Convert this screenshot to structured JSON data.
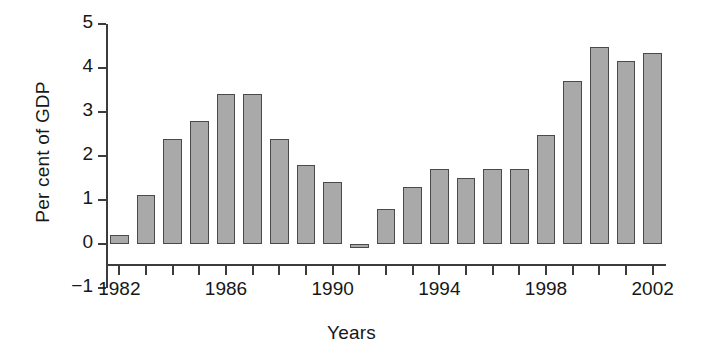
{
  "chart_data": {
    "type": "bar",
    "title": "",
    "xlabel": "Years",
    "ylabel": "Per cent of GDP",
    "categories": [
      1982,
      1983,
      1984,
      1985,
      1986,
      1987,
      1988,
      1989,
      1990,
      1991,
      1992,
      1993,
      1994,
      1995,
      1996,
      1997,
      1998,
      1999,
      2000,
      2001,
      2002
    ],
    "values": [
      0.2,
      1.12,
      2.38,
      2.8,
      3.4,
      3.4,
      2.38,
      1.8,
      1.4,
      -0.08,
      0.8,
      1.3,
      1.7,
      1.5,
      1.7,
      1.7,
      2.48,
      3.7,
      4.48,
      4.15,
      4.35
    ],
    "ylim": [
      -1,
      5
    ],
    "xlim": [
      1981.5,
      2002.5
    ],
    "y_ticks": [
      5,
      4,
      3,
      2,
      1,
      0,
      -1
    ],
    "y_tick_labels": [
      "5",
      "4",
      "3",
      "2",
      "1",
      "0",
      "−1"
    ],
    "x_ticks": [
      1982,
      1983,
      1984,
      1985,
      1986,
      1987,
      1988,
      1989,
      1990,
      1991,
      1992,
      1993,
      1994,
      1995,
      1996,
      1997,
      1998,
      1999,
      2000,
      2001,
      2002
    ],
    "x_tick_labels_shown": [
      "1982",
      "1986",
      "1990",
      "1994",
      "1998",
      "2002"
    ],
    "x_labeled_years": [
      1982,
      1986,
      1990,
      1994,
      1998,
      2002
    ],
    "grid": false,
    "legend": null,
    "bar_fill_color": "#a9a9a9",
    "bar_edge_color": "#4a4a4a",
    "axis_color": "#3c3c3c",
    "background_color": "#ffffff"
  },
  "axes": {
    "y_title": "Per cent of GDP",
    "x_title": "Years"
  }
}
